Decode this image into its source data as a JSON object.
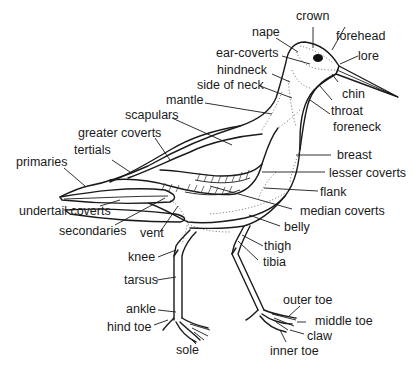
{
  "diagram": {
    "labels": [
      {
        "id": "crown",
        "text": "crown"
      },
      {
        "id": "nape",
        "text": "nape"
      },
      {
        "id": "forehead",
        "text": "forehead"
      },
      {
        "id": "ear_coverts",
        "text": "ear-coverts"
      },
      {
        "id": "lore",
        "text": "lore"
      },
      {
        "id": "hindneck",
        "text": "hindneck"
      },
      {
        "id": "side_of_neck",
        "text": "side of neck"
      },
      {
        "id": "chin",
        "text": "chin"
      },
      {
        "id": "mantle",
        "text": "mantle"
      },
      {
        "id": "throat",
        "text": "throat"
      },
      {
        "id": "foreneck",
        "text": "foreneck"
      },
      {
        "id": "scapulars",
        "text": "scapulars"
      },
      {
        "id": "greater_coverts",
        "text": "greater coverts"
      },
      {
        "id": "breast",
        "text": "breast"
      },
      {
        "id": "tertials",
        "text": "tertials"
      },
      {
        "id": "primaries",
        "text": "primaries"
      },
      {
        "id": "lesser_coverts",
        "text": "lesser coverts"
      },
      {
        "id": "flank",
        "text": "flank"
      },
      {
        "id": "undertail_coverts",
        "text": "undertail coverts"
      },
      {
        "id": "median_coverts",
        "text": "median coverts"
      },
      {
        "id": "secondaries",
        "text": "secondaries"
      },
      {
        "id": "vent",
        "text": "vent"
      },
      {
        "id": "belly",
        "text": "belly"
      },
      {
        "id": "thigh",
        "text": "thigh"
      },
      {
        "id": "knee",
        "text": "knee"
      },
      {
        "id": "tibia",
        "text": "tibia"
      },
      {
        "id": "tarsus",
        "text": "tarsus"
      },
      {
        "id": "outer_toe",
        "text": "outer toe"
      },
      {
        "id": "ankle",
        "text": "ankle"
      },
      {
        "id": "middle_toe",
        "text": "middle toe"
      },
      {
        "id": "hind_toe",
        "text": "hind toe"
      },
      {
        "id": "claw",
        "text": "claw"
      },
      {
        "id": "sole",
        "text": "sole"
      },
      {
        "id": "inner_toe",
        "text": "inner toe"
      }
    ]
  }
}
